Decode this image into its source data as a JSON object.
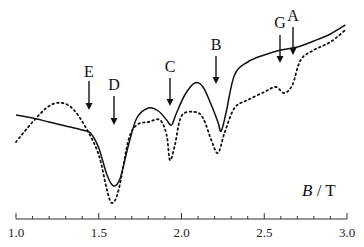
{
  "chart_data": {
    "type": "line",
    "title": "",
    "xlabel": "B / T",
    "xlabel_italic_part": "B",
    "xlabel_unit": " / T",
    "ylabel": "",
    "xlim": [
      1.0,
      3.0
    ],
    "x_ticks": [
      "1.0",
      "1.5",
      "2.0",
      "2.5",
      "3.0"
    ],
    "x_tick_values": [
      1.0,
      1.5,
      2.0,
      2.5,
      3.0
    ],
    "minor_tick_step": 0.1,
    "y_axis_visible": false,
    "grid": false,
    "legend": null,
    "series": [
      {
        "name": "solid",
        "style": "solid",
        "color": "#111111",
        "x": [
          1.0,
          1.1,
          1.2,
          1.3,
          1.4,
          1.45,
          1.5,
          1.55,
          1.59,
          1.63,
          1.68,
          1.73,
          1.8,
          1.86,
          1.91,
          1.94,
          1.97,
          2.02,
          2.08,
          2.13,
          2.18,
          2.22,
          2.24,
          2.27,
          2.32,
          2.4,
          2.5,
          2.6,
          2.7,
          2.8,
          2.9,
          2.99
        ],
        "y": [
          115,
          118,
          122,
          126,
          130,
          133,
          148,
          175,
          186,
          178,
          145,
          118,
          108,
          111,
          120,
          125,
          113,
          95,
          83,
          87,
          105,
          122,
          131,
          112,
          75,
          62,
          55,
          50,
          47,
          41,
          34,
          25
        ]
      },
      {
        "name": "dotted",
        "style": "dotted",
        "color": "#111111",
        "x": [
          1.0,
          1.1,
          1.2,
          1.28,
          1.35,
          1.43,
          1.5,
          1.55,
          1.58,
          1.62,
          1.68,
          1.73,
          1.8,
          1.87,
          1.91,
          1.93,
          1.96,
          2.0,
          2.08,
          2.13,
          2.18,
          2.22,
          2.26,
          2.32,
          2.4,
          2.5,
          2.57,
          2.62,
          2.67,
          2.72,
          2.8,
          2.9,
          2.99
        ],
        "y": [
          142,
          122,
          106,
          103,
          110,
          130,
          155,
          190,
          203,
          190,
          140,
          125,
          122,
          120,
          135,
          160,
          145,
          116,
          112,
          118,
          140,
          153,
          133,
          108,
          100,
          92,
          87,
          93,
          85,
          60,
          50,
          42,
          30
        ]
      }
    ],
    "annotations": [
      {
        "label": "E",
        "x": 1.44,
        "arrow_top": 134,
        "arrow_bottom": 158,
        "label_y": 131
      },
      {
        "label": "D",
        "x": 1.59,
        "arrow_top": 131,
        "arrow_bottom": 156,
        "label_y": 141
      },
      {
        "label": "C",
        "x": 1.93,
        "arrow_top": 131,
        "arrow_bottom": 130,
        "label_y": 128
      },
      {
        "label": "B",
        "x": 2.21,
        "arrow_top": 53,
        "arrow_bottom": 79,
        "label_y": 50
      },
      {
        "label": "G",
        "x": 2.59,
        "arrow_top": 29,
        "arrow_bottom": 62,
        "label_y": 26
      },
      {
        "label": "A",
        "x": 2.66,
        "arrow_top": 27,
        "arrow_bottom": 54,
        "label_y": 20
      }
    ],
    "y_units": "pixel-space (arbitrary intensity, no y-axis shown)"
  },
  "labels": {
    "E": "E",
    "D": "D",
    "C": "C",
    "B": "B",
    "G": "G",
    "A": "A"
  },
  "axis": {
    "title_italic": "B",
    "title_rest": " / T",
    "ticks": [
      "1.0",
      "1.5",
      "2.0",
      "2.5",
      "3.0"
    ]
  }
}
